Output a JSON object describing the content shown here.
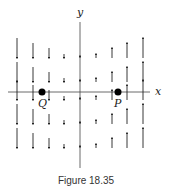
{
  "figure": {
    "caption": "Figure 18.35",
    "axes": {
      "x_label": "x",
      "y_label": "y"
    },
    "points": [
      {
        "name": "Q",
        "label": "Q",
        "x_px": 42,
        "y_px": 92
      },
      {
        "name": "P",
        "label": "P",
        "x_px": 118,
        "y_px": 92
      }
    ],
    "vector_field": {
      "description": "Vertical vectors: pointing down for x<0, up for x>0, magnitude growing with |x|",
      "columns_x_px": [
        17,
        33,
        49,
        64,
        80,
        96,
        112,
        127,
        143
      ],
      "column_lengths_px": [
        -20,
        -15,
        -10,
        -4,
        2,
        4,
        10,
        15,
        20
      ],
      "rows_y_px": [
        58,
        82,
        100,
        124,
        148
      ]
    },
    "colors": {
      "ink": "#222222",
      "background": "#ffffff"
    }
  }
}
